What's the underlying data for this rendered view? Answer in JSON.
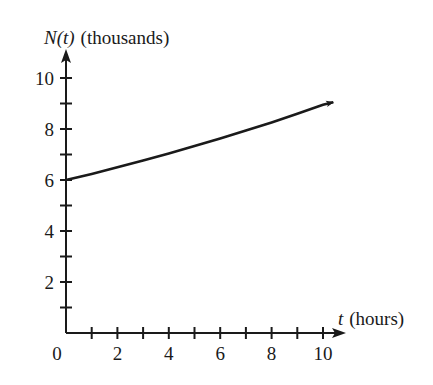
{
  "chart_data": {
    "type": "line",
    "title": "",
    "xlabel_var": "t",
    "xlabel_unit": "(hours)",
    "ylabel_var": "N(t)",
    "ylabel_unit": "(thousands)",
    "xlim": [
      0,
      10.4
    ],
    "ylim": [
      0,
      11
    ],
    "x_ticks": [
      1,
      2,
      3,
      4,
      5,
      6,
      7,
      8,
      9,
      10
    ],
    "x_tick_labels": [
      "0",
      "2",
      "4",
      "6",
      "8",
      "10"
    ],
    "y_ticks": [
      1,
      2,
      3,
      4,
      5,
      6,
      7,
      8,
      9,
      10
    ],
    "y_tick_labels": [
      "2",
      "4",
      "6",
      "8",
      "10"
    ],
    "grid": false,
    "legend": null,
    "series": [
      {
        "name": "N(t)",
        "description": "Increasing exponential-type growth curve ending in an arrow",
        "x": [
          0,
          1,
          2,
          3,
          4,
          5,
          6,
          7,
          8,
          9,
          10,
          10.4
        ],
        "y": [
          6.0,
          6.24,
          6.5,
          6.76,
          7.04,
          7.33,
          7.63,
          7.94,
          8.26,
          8.6,
          8.95,
          9.05
        ]
      }
    ]
  }
}
